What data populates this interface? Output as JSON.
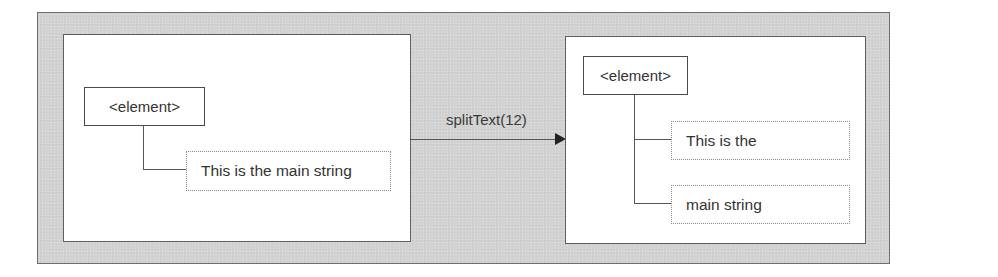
{
  "diagram": {
    "title": "",
    "before": {
      "element_label": "<element>",
      "text_nodes": [
        "This is the main string"
      ]
    },
    "operation": {
      "label": "splitText(12)",
      "direction": "left-to-right"
    },
    "after": {
      "element_label": "<element>",
      "text_nodes": [
        "This is the",
        "main string"
      ]
    },
    "colors": {
      "frame_background": "#d2d2d2",
      "panel_background": "#ffffff",
      "line": "#555555",
      "arrowhead": "#222222"
    }
  }
}
